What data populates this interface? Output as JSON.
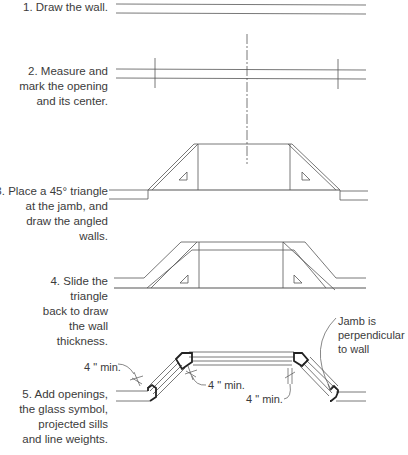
{
  "steps": [
    {
      "id": 1,
      "lines": [
        "1. Draw the wall."
      ]
    },
    {
      "id": 2,
      "lines": [
        "2. Measure and",
        "mark the opening",
        "and its center."
      ]
    },
    {
      "id": 3,
      "lines": [
        "3. Place a 45° triangle",
        "at the jamb, and",
        "draw the angled",
        "walls."
      ]
    },
    {
      "id": 4,
      "lines": [
        "4. Slide the",
        "triangle",
        "back to draw",
        "the wall",
        "thickness."
      ]
    },
    {
      "id": 5,
      "lines": [
        "5. Add openings,",
        "the glass symbol,",
        "projected sills",
        "and line weights."
      ]
    }
  ],
  "annotations": {
    "min_left": "4 \" min.",
    "min_center": "4 \" min.",
    "min_right": "4 \" min.",
    "jamb_note": [
      "Jamb is",
      "perpendicular",
      "to wall"
    ]
  },
  "colors": {
    "line": "#555555",
    "text": "#3b3b3b",
    "background": "#ffffff"
  }
}
